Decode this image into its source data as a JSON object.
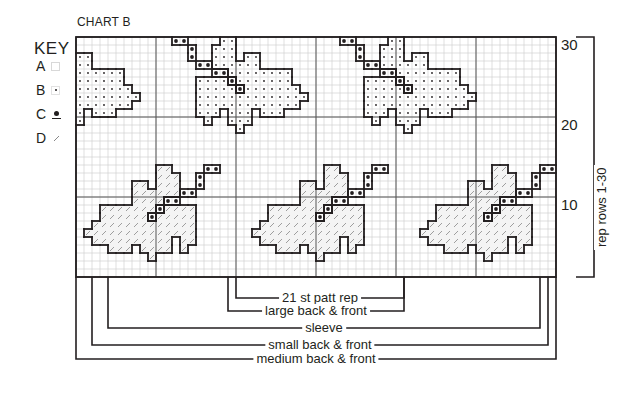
{
  "title": "CHART B",
  "key": {
    "title": "KEY",
    "items": [
      {
        "letter": "A",
        "symbol": "empty-square"
      },
      {
        "letter": "B",
        "symbol": "small-dot"
      },
      {
        "letter": "C",
        "symbol": "large-dot"
      },
      {
        "letter": "D",
        "symbol": "diagonal-hatch"
      }
    ]
  },
  "grid": {
    "columns": 60,
    "rows": 30,
    "major_every": 10,
    "row_numbers": [
      "30",
      "20",
      "10"
    ]
  },
  "rep_label": "rep rows 1-30",
  "motif_repeat_width": 21,
  "motifs": {
    "upper": {
      "offsets": [
        -21,
        0,
        21
      ],
      "B": [
        [
          0,
          18
        ],
        [
          0,
          19
        ],
        [
          1,
          17
        ],
        [
          1,
          18
        ],
        [
          1,
          19
        ],
        [
          2,
          17
        ],
        [
          2,
          18
        ],
        [
          2,
          19
        ],
        [
          2,
          21
        ],
        [
          2,
          22
        ],
        [
          3,
          17
        ],
        [
          3,
          18
        ],
        [
          3,
          19
        ],
        [
          3,
          20
        ],
        [
          3,
          21
        ],
        [
          3,
          22
        ],
        [
          4,
          19
        ],
        [
          4,
          20
        ],
        [
          4,
          21
        ],
        [
          4,
          22
        ],
        [
          4,
          23
        ],
        [
          4,
          24
        ],
        [
          4,
          25
        ],
        [
          4,
          26
        ],
        [
          5,
          15
        ],
        [
          5,
          16
        ],
        [
          5,
          17
        ],
        [
          5,
          18
        ],
        [
          5,
          20
        ],
        [
          5,
          21
        ],
        [
          5,
          22
        ],
        [
          5,
          23
        ],
        [
          5,
          24
        ],
        [
          5,
          25
        ],
        [
          5,
          26
        ],
        [
          6,
          15
        ],
        [
          6,
          16
        ],
        [
          6,
          17
        ],
        [
          6,
          18
        ],
        [
          6,
          19
        ],
        [
          6,
          21
        ],
        [
          6,
          22
        ],
        [
          6,
          23
        ],
        [
          6,
          24
        ],
        [
          6,
          25
        ],
        [
          6,
          26
        ],
        [
          6,
          27
        ],
        [
          7,
          15
        ],
        [
          7,
          16
        ],
        [
          7,
          17
        ],
        [
          7,
          18
        ],
        [
          7,
          19
        ],
        [
          7,
          20
        ],
        [
          7,
          21
        ],
        [
          7,
          22
        ],
        [
          7,
          23
        ],
        [
          7,
          24
        ],
        [
          7,
          25
        ],
        [
          7,
          26
        ],
        [
          7,
          27
        ],
        [
          7,
          28
        ],
        [
          8,
          15
        ],
        [
          8,
          16
        ],
        [
          8,
          17
        ],
        [
          8,
          18
        ],
        [
          8,
          19
        ],
        [
          8,
          20
        ],
        [
          8,
          21
        ],
        [
          8,
          22
        ],
        [
          8,
          23
        ],
        [
          8,
          24
        ],
        [
          8,
          25
        ],
        [
          8,
          26
        ],
        [
          8,
          27
        ],
        [
          9,
          15
        ],
        [
          9,
          16
        ],
        [
          9,
          17
        ],
        [
          9,
          19
        ],
        [
          9,
          20
        ],
        [
          9,
          21
        ],
        [
          9,
          23
        ],
        [
          9,
          24
        ],
        [
          9,
          25
        ],
        [
          10,
          16
        ],
        [
          10,
          19
        ],
        [
          10,
          20
        ],
        [
          10,
          21
        ],
        [
          11,
          20
        ]
      ],
      "C": [
        [
          0,
          12
        ],
        [
          0,
          13
        ],
        [
          1,
          14
        ],
        [
          2,
          14
        ],
        [
          3,
          15
        ],
        [
          3,
          16
        ],
        [
          4,
          17
        ],
        [
          4,
          18
        ],
        [
          5,
          19
        ],
        [
          6,
          20
        ]
      ]
    },
    "lower": {
      "offsets": [
        0,
        21,
        42
      ],
      "D": [
        [
          16,
          10
        ],
        [
          16,
          11
        ],
        [
          17,
          10
        ],
        [
          17,
          11
        ],
        [
          17,
          12
        ],
        [
          18,
          7
        ],
        [
          18,
          8
        ],
        [
          18,
          10
        ],
        [
          18,
          11
        ],
        [
          18,
          12
        ],
        [
          19,
          7
        ],
        [
          19,
          8
        ],
        [
          19,
          9
        ],
        [
          19,
          10
        ],
        [
          19,
          11
        ],
        [
          19,
          12
        ],
        [
          20,
          7
        ],
        [
          20,
          8
        ],
        [
          20,
          9
        ],
        [
          20,
          10
        ],
        [
          21,
          3
        ],
        [
          21,
          4
        ],
        [
          21,
          5
        ],
        [
          21,
          6
        ],
        [
          21,
          7
        ],
        [
          21,
          8
        ],
        [
          21,
          9
        ],
        [
          21,
          11
        ],
        [
          21,
          12
        ],
        [
          21,
          13
        ],
        [
          21,
          14
        ],
        [
          22,
          3
        ],
        [
          22,
          4
        ],
        [
          22,
          5
        ],
        [
          22,
          6
        ],
        [
          22,
          7
        ],
        [
          22,
          8
        ],
        [
          22,
          10
        ],
        [
          22,
          11
        ],
        [
          22,
          12
        ],
        [
          22,
          13
        ],
        [
          22,
          14
        ],
        [
          23,
          2
        ],
        [
          23,
          3
        ],
        [
          23,
          4
        ],
        [
          23,
          5
        ],
        [
          23,
          6
        ],
        [
          23,
          7
        ],
        [
          23,
          8
        ],
        [
          23,
          9
        ],
        [
          23,
          10
        ],
        [
          23,
          11
        ],
        [
          23,
          12
        ],
        [
          23,
          13
        ],
        [
          23,
          14
        ],
        [
          24,
          1
        ],
        [
          24,
          2
        ],
        [
          24,
          3
        ],
        [
          24,
          4
        ],
        [
          24,
          5
        ],
        [
          24,
          6
        ],
        [
          24,
          7
        ],
        [
          24,
          8
        ],
        [
          24,
          9
        ],
        [
          24,
          10
        ],
        [
          24,
          11
        ],
        [
          24,
          12
        ],
        [
          24,
          13
        ],
        [
          24,
          14
        ],
        [
          25,
          2
        ],
        [
          25,
          3
        ],
        [
          25,
          4
        ],
        [
          25,
          5
        ],
        [
          25,
          6
        ],
        [
          25,
          7
        ],
        [
          25,
          8
        ],
        [
          25,
          9
        ],
        [
          25,
          10
        ],
        [
          25,
          11
        ],
        [
          25,
          13
        ],
        [
          25,
          14
        ],
        [
          26,
          4
        ],
        [
          26,
          5
        ],
        [
          26,
          6
        ],
        [
          26,
          8
        ],
        [
          26,
          9
        ],
        [
          26,
          10
        ],
        [
          26,
          11
        ],
        [
          26,
          13
        ],
        [
          27,
          9
        ]
      ],
      "C": [
        [
          16,
          16
        ],
        [
          16,
          17
        ],
        [
          17,
          15
        ],
        [
          18,
          15
        ],
        [
          19,
          13
        ],
        [
          19,
          14
        ],
        [
          20,
          11
        ],
        [
          20,
          12
        ],
        [
          21,
          10
        ],
        [
          22,
          9
        ]
      ]
    }
  },
  "size_brackets": [
    {
      "label": "21 st patt rep",
      "from_col": 20,
      "to_col": 41
    },
    {
      "label": "large back & front",
      "from_col": 19,
      "to_col": 41
    },
    {
      "label": "sleeve",
      "from_col": 4,
      "to_col": 58
    },
    {
      "label": "small back & front",
      "from_col": 2,
      "to_col": 60
    },
    {
      "label": "medium back & front",
      "from_col": 0,
      "to_col": 60
    }
  ]
}
